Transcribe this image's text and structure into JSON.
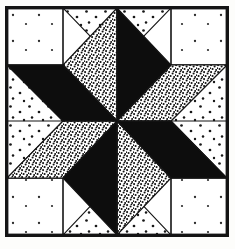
{
  "artwork": {
    "title": "Eight-Pointed Star Quilt Block",
    "kind": "quilt-block-diagram",
    "medium": "line drawing with stippled fabric shading",
    "frame": {
      "border_color": "#141414",
      "border_width_px": 2,
      "x": 5,
      "y": 6,
      "width": 224,
      "height": 231
    },
    "palette": {
      "ink": "#141414",
      "paper": "#ffffff",
      "solid_dark": "#0d0d0d",
      "dense_stipple": "#6f6f6f",
      "sparse_stipple": "#e6e6e6",
      "plain_white": "#ffffff"
    },
    "fabric_legend": [
      {
        "key": "solid_dark",
        "label": "Solid dark fabric",
        "swatch": "#0d0d0d"
      },
      {
        "key": "dense_stipple",
        "label": "Dense stipple fabric",
        "swatch": "#6f6f6f"
      },
      {
        "key": "sparse_stipple",
        "label": "Sparse dot fabric",
        "swatch": "#e6e6e6"
      },
      {
        "key": "plain_white",
        "label": "Plain white fabric",
        "swatch": "#ffffff"
      }
    ],
    "geometry": {
      "center": {
        "x": 118,
        "y": 122
      },
      "inner_left": 7,
      "inner_top": 8,
      "inner_right": 227,
      "inner_bottom": 235,
      "corner_square_size": 56,
      "star_points": 8
    },
    "star_points_list": [
      {
        "index": 0,
        "compass": "N-left",
        "fabric": "dense_stipple"
      },
      {
        "index": 1,
        "compass": "N-right",
        "fabric": "solid_dark"
      },
      {
        "index": 2,
        "compass": "E-up",
        "fabric": "dense_stipple"
      },
      {
        "index": 3,
        "compass": "E-down",
        "fabric": "solid_dark"
      },
      {
        "index": 4,
        "compass": "S-right",
        "fabric": "dense_stipple"
      },
      {
        "index": 5,
        "compass": "S-left",
        "fabric": "solid_dark"
      },
      {
        "index": 6,
        "compass": "W-down",
        "fabric": "dense_stipple"
      },
      {
        "index": 7,
        "compass": "W-up",
        "fabric": "solid_dark"
      }
    ],
    "corner_squares": [
      {
        "position": "top-left",
        "fabric": "plain_white"
      },
      {
        "position": "top-right",
        "fabric": "plain_white"
      },
      {
        "position": "bottom-left",
        "fabric": "plain_white"
      },
      {
        "position": "bottom-right",
        "fabric": "plain_white"
      }
    ],
    "edge_triangles": [
      {
        "position": "top",
        "fabric": "sparse_stipple"
      },
      {
        "position": "right",
        "fabric": "sparse_stipple"
      },
      {
        "position": "bottom",
        "fabric": "sparse_stipple"
      },
      {
        "position": "left",
        "fabric": "sparse_stipple"
      }
    ]
  }
}
